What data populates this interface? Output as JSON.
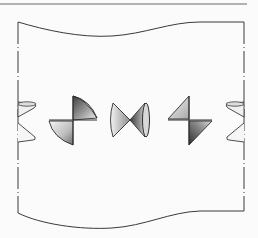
{
  "diagram": {
    "title": "",
    "colors": {
      "stroke": "#3a3a3a",
      "top_rule": "#6a6a6a",
      "background": "#fbfbfb",
      "shade_light": "#f2f2f2",
      "shade_mid": "#b8b8b8",
      "shade_dark": "#4a4a4a"
    },
    "elements": [
      {
        "id": "top-rule",
        "type": "line"
      },
      {
        "id": "sheet",
        "type": "wavy-sheet",
        "left_x": 18,
        "right_x": 244
      },
      {
        "id": "partial-cone-left",
        "type": "cone-pair-partial",
        "center": [
          18,
          122
        ]
      },
      {
        "id": "bowtie-1",
        "type": "cone-pair",
        "center": [
          73,
          120
        ],
        "orientation": "diagonal"
      },
      {
        "id": "bowtie-2",
        "type": "cone-pair",
        "center": [
          130,
          120
        ],
        "orientation": "horizontal"
      },
      {
        "id": "bowtie-3",
        "type": "cone-pair",
        "center": [
          189,
          120
        ],
        "orientation": "diagonal-mirrored"
      },
      {
        "id": "partial-cone-right",
        "type": "cone-pair-partial",
        "center": [
          244,
          122
        ]
      }
    ]
  }
}
